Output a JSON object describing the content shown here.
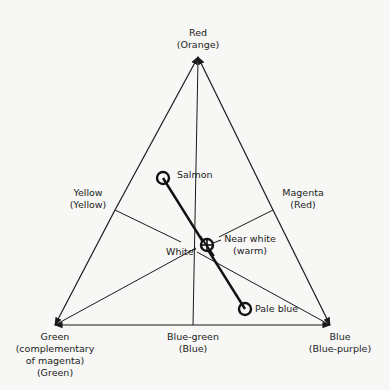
{
  "vertices": {
    "top": {
      "name": "Red",
      "alt": "(Orange)"
    },
    "left": {
      "name": "Green",
      "sub": "(complementary",
      "sub2": "of magenta)",
      "alt": "(Green)"
    },
    "right": {
      "name": "Blue",
      "alt": "(Blue-purple)"
    }
  },
  "edges": {
    "left": {
      "name": "Yellow",
      "alt": "(Yellow)"
    },
    "right": {
      "name": "Magenta",
      "alt": "(Red)"
    },
    "bottom": {
      "name": "Blue-green",
      "alt": "(Blue)"
    }
  },
  "center": {
    "name": "White"
  },
  "points": [
    {
      "name": "Salmon"
    },
    {
      "name": "Near white",
      "alt": "(warm)"
    },
    {
      "name": "Pale blue"
    }
  ],
  "colors": {
    "ink": "#1a1a1a",
    "background": "#f7f7f5"
  }
}
